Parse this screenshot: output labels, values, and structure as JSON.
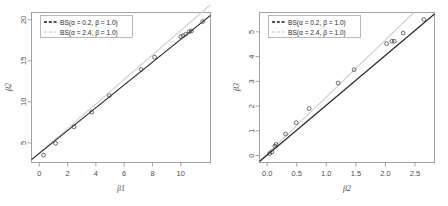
{
  "figure": {
    "background": "#ffffff",
    "panel_count": 2
  },
  "chart_data": [
    {
      "type": "scatter",
      "panel": "left",
      "title": "",
      "xlabel": "β1",
      "ylabel": "β2",
      "xlim": [
        -0.55,
        12.1
      ],
      "ylim": [
        2.6,
        20.9
      ],
      "xticks": [
        0,
        2,
        4,
        6,
        8,
        10
      ],
      "xtick_labels": [
        "0",
        "2",
        "4",
        "6",
        "8",
        "10"
      ],
      "yticks": [
        5,
        10,
        15,
        20
      ],
      "ytick_labels": [
        "5",
        "10",
        "15",
        "20"
      ],
      "grid": false,
      "legend_position": "top-left",
      "points": [
        {
          "x": 0.3,
          "y": 3.5
        },
        {
          "x": 1.15,
          "y": 4.95
        },
        {
          "x": 2.45,
          "y": 6.95
        },
        {
          "x": 3.7,
          "y": 8.75
        },
        {
          "x": 4.95,
          "y": 10.75
        },
        {
          "x": 7.2,
          "y": 13.95
        },
        {
          "x": 8.15,
          "y": 15.45
        },
        {
          "x": 10.0,
          "y": 17.95
        },
        {
          "x": 10.15,
          "y": 18.05
        },
        {
          "x": 10.35,
          "y": 18.25
        },
        {
          "x": 10.6,
          "y": 18.55
        },
        {
          "x": 10.75,
          "y": 18.65
        },
        {
          "x": 11.55,
          "y": 19.8
        }
      ],
      "series": [
        {
          "name": "BS(α = 0.2, β = 1.0)",
          "color": "#262626",
          "style": "solid",
          "line_x": [
            -0.55,
            12.1
          ],
          "line_y": [
            2.95,
            20.55
          ]
        },
        {
          "name": "BS(α = 2.4, β = 1.0)",
          "color": "#d2d2d2",
          "style": "solid",
          "line_x": [
            -0.55,
            12.1
          ],
          "line_y": [
            2.95,
            21.85
          ]
        }
      ]
    },
    {
      "type": "scatter",
      "panel": "right",
      "title": "",
      "xlabel": "β2",
      "ylabel": "β3",
      "xlim": [
        -0.13,
        2.83
      ],
      "ylim": [
        -0.28,
        5.78
      ],
      "xticks": [
        0.0,
        0.5,
        1.0,
        1.5,
        2.0,
        2.5
      ],
      "xtick_labels": [
        "0.0",
        "0.5",
        "1.0",
        "1.5",
        "2.0",
        "2.5"
      ],
      "yticks": [
        0,
        1,
        2,
        3,
        4,
        5
      ],
      "ytick_labels": [
        "0",
        "1",
        "2",
        "3",
        "4",
        "5"
      ],
      "grid": false,
      "legend_position": "top-left",
      "points": [
        {
          "x": 0.04,
          "y": 0.08
        },
        {
          "x": 0.08,
          "y": 0.15
        },
        {
          "x": 0.13,
          "y": 0.38
        },
        {
          "x": 0.15,
          "y": 0.45
        },
        {
          "x": 0.31,
          "y": 0.87
        },
        {
          "x": 0.49,
          "y": 1.33
        },
        {
          "x": 0.71,
          "y": 1.9
        },
        {
          "x": 1.2,
          "y": 2.93
        },
        {
          "x": 1.47,
          "y": 3.47
        },
        {
          "x": 2.02,
          "y": 4.52
        },
        {
          "x": 2.11,
          "y": 4.62
        },
        {
          "x": 2.15,
          "y": 4.62
        },
        {
          "x": 2.3,
          "y": 4.95
        },
        {
          "x": 2.65,
          "y": 5.5
        }
      ],
      "series": [
        {
          "name": "BS(α = 0.2, β = 1.0)",
          "color": "#262626",
          "style": "solid",
          "line_x": [
            -0.13,
            2.83
          ],
          "line_y": [
            -0.24,
            5.72
          ]
        },
        {
          "name": "BS(α = 2.4, β = 1.0)",
          "color": "#d2d2d2",
          "style": "solid",
          "line_x": [
            -0.13,
            2.48
          ],
          "line_y": [
            -0.24,
            5.78
          ]
        }
      ]
    }
  ],
  "legend": {
    "entries": [
      {
        "label": "BS(α = 0.2, β = 1.0)",
        "color": "#1a1a1a",
        "style": "dashed"
      },
      {
        "label": "BS(α = 2.4, β = 1.0)",
        "color": "#d8d8d8",
        "style": "dashed"
      }
    ]
  },
  "left_panel": {
    "xlabel": "β1",
    "ylabel": "β2",
    "xtick_labels": [
      "0",
      "2",
      "4",
      "6",
      "8",
      "10"
    ],
    "ytick_labels": [
      "5",
      "10",
      "15",
      "20"
    ],
    "legend_entry_1": "BS(α = 0.2, β = 1.0)",
    "legend_entry_2": "BS(α = 2.4, β = 1.0)"
  },
  "right_panel": {
    "xlabel": "β2",
    "ylabel": "β3",
    "xtick_labels": [
      "0.0",
      "0.5",
      "1.0",
      "1.5",
      "2.0",
      "2.5"
    ],
    "ytick_labels": [
      "0",
      "1",
      "2",
      "3",
      "4",
      "5"
    ],
    "legend_entry_1": "BS(α = 0.2, β = 1.0)",
    "legend_entry_2": "BS(α = 2.4, β = 1.0)"
  }
}
